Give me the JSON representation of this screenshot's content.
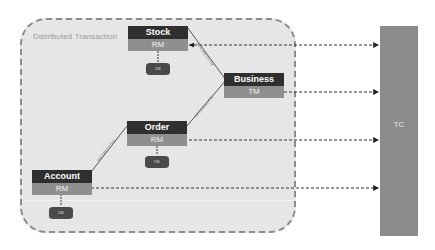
{
  "container": {
    "title": "Distributed Transaction"
  },
  "nodes": {
    "stock": {
      "name": "Stock",
      "role": "RM",
      "db": "DB"
    },
    "business": {
      "name": "Business",
      "role": "TM"
    },
    "order": {
      "name": "Order",
      "role": "RM",
      "db": "DB"
    },
    "account": {
      "name": "Account",
      "role": "RM",
      "db": "DB"
    }
  },
  "tc": {
    "label": "TC"
  },
  "edges": {
    "business_stock": "RPC/REST/TM",
    "business_order": "RPC/REST/TM",
    "order_account": "RPC/REST/TM"
  },
  "colors": {
    "container_bg": "#e6e6e6",
    "node_header": "#2f2f2f",
    "node_role": "#8f8f8f",
    "db": "#4a4a4a",
    "tc": "#8b8b8b"
  }
}
